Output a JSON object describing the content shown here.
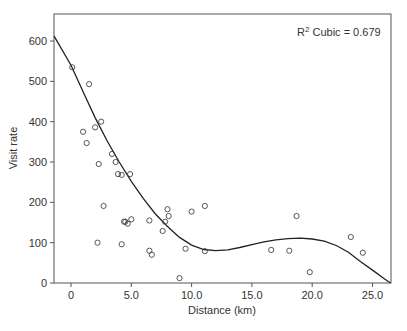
{
  "chart_data": {
    "type": "scatter",
    "title": "",
    "xlabel": "Distance (km)",
    "ylabel": "Visit rate",
    "xlim": [
      -1.4,
      26.5
    ],
    "ylim": [
      0,
      660
    ],
    "x_ticks": [
      0,
      5,
      10,
      15,
      20,
      25
    ],
    "x_tick_labels": [
      "0",
      "5.0",
      "10.0",
      "15.0",
      "20.0",
      "25.0"
    ],
    "y_ticks": [
      0,
      100,
      200,
      300,
      400,
      500,
      600
    ],
    "y_tick_labels": [
      "0",
      "100",
      "200",
      "300",
      "400",
      "500",
      "600"
    ],
    "grid": false,
    "annotation": {
      "text_base": "R",
      "superscript": "2",
      "text_rest": " Cubic = 0.679"
    },
    "series": [
      {
        "name": "Observed",
        "marker": "open-circle",
        "points": [
          [
            0.1,
            535
          ],
          [
            1.5,
            493
          ],
          [
            2.5,
            400
          ],
          [
            2.0,
            386
          ],
          [
            1.0,
            375
          ],
          [
            1.3,
            347
          ],
          [
            2.3,
            295
          ],
          [
            3.4,
            320
          ],
          [
            3.7,
            300
          ],
          [
            3.9,
            270
          ],
          [
            4.2,
            268
          ],
          [
            4.9,
            270
          ],
          [
            2.7,
            191
          ],
          [
            4.4,
            152
          ],
          [
            4.5,
            152
          ],
          [
            4.7,
            147
          ],
          [
            5.0,
            158
          ],
          [
            2.2,
            100
          ],
          [
            4.2,
            96
          ],
          [
            6.5,
            155
          ],
          [
            6.5,
            80
          ],
          [
            6.7,
            70
          ],
          [
            8.0,
            183
          ],
          [
            8.1,
            166
          ],
          [
            7.8,
            152
          ],
          [
            7.6,
            129
          ],
          [
            10.0,
            177
          ],
          [
            11.1,
            191
          ],
          [
            9.5,
            85
          ],
          [
            11.1,
            79
          ],
          [
            9.0,
            12
          ],
          [
            16.6,
            82
          ],
          [
            18.1,
            80
          ],
          [
            18.7,
            166
          ],
          [
            19.8,
            27
          ],
          [
            23.2,
            114
          ],
          [
            24.2,
            75
          ]
        ]
      },
      {
        "name": "Cubic fit",
        "type": "line",
        "points": [
          [
            -1.4,
            612
          ],
          [
            0,
            540
          ],
          [
            1,
            474
          ],
          [
            2,
            410
          ],
          [
            3,
            352
          ],
          [
            4,
            300
          ],
          [
            5,
            252
          ],
          [
            6,
            209
          ],
          [
            7,
            171
          ],
          [
            8,
            140
          ],
          [
            9,
            113
          ],
          [
            10,
            94
          ],
          [
            11,
            83
          ],
          [
            12,
            80
          ],
          [
            13,
            82
          ],
          [
            14,
            88
          ],
          [
            15,
            95
          ],
          [
            16,
            102
          ],
          [
            17,
            107
          ],
          [
            18,
            110
          ],
          [
            19,
            111
          ],
          [
            20,
            109
          ],
          [
            21,
            104
          ],
          [
            22,
            93
          ],
          [
            23,
            76
          ],
          [
            24,
            53
          ],
          [
            25,
            32
          ],
          [
            26,
            10
          ],
          [
            26.5,
            0
          ]
        ]
      }
    ]
  }
}
